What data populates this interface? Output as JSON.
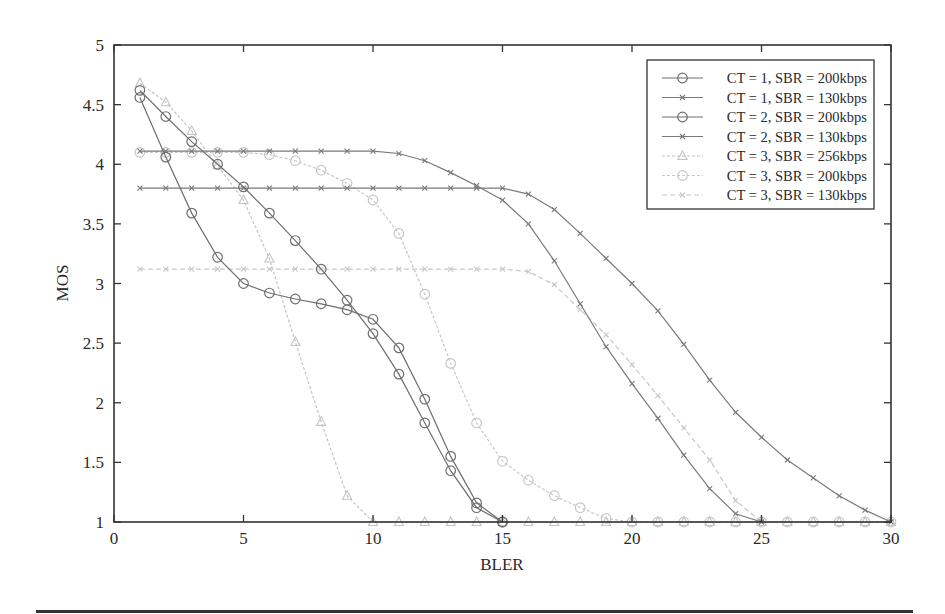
{
  "chart_data": {
    "type": "line",
    "title": "",
    "xlabel": "BLER",
    "ylabel": "MOS",
    "xlim": [
      0,
      30
    ],
    "ylim": [
      1,
      5
    ],
    "xticks": [
      0,
      5,
      10,
      15,
      20,
      25,
      30
    ],
    "yticks": [
      1,
      1.5,
      2,
      2.5,
      3,
      3.5,
      4,
      4.5,
      5
    ],
    "xtick_labels": [
      "0",
      "5",
      "10",
      "15",
      "20",
      "25",
      "30"
    ],
    "ytick_labels": [
      "1",
      "1.5",
      "2",
      "2.5",
      "3",
      "3.5",
      "4",
      "4.5",
      "5"
    ],
    "grid": false,
    "legend_position": "upper right",
    "series": [
      {
        "name": "CT = 1, SBR = 200kbps",
        "marker": "circle",
        "color": "#6e6e6e",
        "dash": "",
        "x": [
          1,
          2,
          3,
          4,
          5,
          6,
          7,
          8,
          9,
          10,
          11,
          12,
          13,
          14,
          15
        ],
        "values": [
          4.56,
          4.06,
          3.59,
          3.22,
          3.0,
          2.92,
          2.87,
          2.83,
          2.78,
          2.7,
          2.46,
          2.03,
          1.55,
          1.16,
          1.0
        ]
      },
      {
        "name": "CT = 1, SBR = 130kbps",
        "marker": "x",
        "color": "#7a7a7a",
        "dash": "",
        "x": [
          1,
          2,
          3,
          4,
          5,
          6,
          7,
          8,
          9,
          10,
          11,
          12,
          13,
          14,
          15,
          16,
          17,
          18,
          19,
          20,
          21,
          22,
          23,
          24,
          25
        ],
        "values": [
          4.11,
          4.11,
          4.11,
          4.11,
          4.11,
          4.11,
          4.11,
          4.11,
          4.11,
          4.11,
          4.09,
          4.03,
          3.93,
          3.82,
          3.7,
          3.5,
          3.19,
          2.83,
          2.47,
          2.16,
          1.87,
          1.56,
          1.28,
          1.07,
          1.0
        ]
      },
      {
        "name": "CT = 2, SBR = 200kbps",
        "marker": "circle",
        "color": "#6e6e6e",
        "dash": "",
        "x": [
          1,
          2,
          3,
          4,
          5,
          6,
          7,
          8,
          9,
          10,
          11,
          12,
          13,
          14,
          15
        ],
        "values": [
          4.62,
          4.4,
          4.19,
          4.0,
          3.81,
          3.59,
          3.36,
          3.12,
          2.86,
          2.58,
          2.24,
          1.83,
          1.43,
          1.12,
          1.0
        ]
      },
      {
        "name": "CT = 2, SBR = 130kbps",
        "marker": "x",
        "color": "#7a7a7a",
        "dash": "",
        "x": [
          1,
          2,
          3,
          4,
          5,
          6,
          7,
          8,
          9,
          10,
          11,
          12,
          13,
          14,
          15,
          16,
          17,
          18,
          19,
          20,
          21,
          22,
          23,
          24,
          25,
          26,
          27,
          28,
          29,
          30
        ],
        "values": [
          3.8,
          3.8,
          3.8,
          3.8,
          3.8,
          3.8,
          3.8,
          3.8,
          3.8,
          3.8,
          3.8,
          3.8,
          3.8,
          3.8,
          3.8,
          3.75,
          3.62,
          3.42,
          3.21,
          3.0,
          2.77,
          2.49,
          2.19,
          1.92,
          1.71,
          1.52,
          1.37,
          1.22,
          1.1,
          1.0
        ]
      },
      {
        "name": "CT = 3, SBR = 256kbps",
        "marker": "triangle",
        "color": "#c4c4c4",
        "dash": "3,2",
        "x": [
          1,
          2,
          3,
          4,
          5,
          6,
          7,
          8,
          9,
          10,
          11,
          12,
          13,
          14,
          15,
          16,
          17,
          18,
          19,
          20,
          21,
          22,
          23,
          24,
          25,
          26,
          27,
          28,
          29,
          30
        ],
        "values": [
          4.68,
          4.52,
          4.28,
          3.99,
          3.7,
          3.21,
          2.51,
          1.84,
          1.22,
          1.0,
          1.0,
          1.0,
          1.0,
          1.0,
          1.0,
          1.0,
          1.0,
          1.0,
          1.0,
          1.0,
          1.0,
          1.0,
          1.0,
          1.0,
          1.0,
          1.0,
          1.0,
          1.0,
          1.0,
          1.0
        ]
      },
      {
        "name": "CT = 3, SBR = 200kbps",
        "marker": "circle",
        "color": "#c8c8c8",
        "dash": "3,2",
        "x": [
          1,
          2,
          3,
          4,
          5,
          6,
          7,
          8,
          9,
          10,
          11,
          12,
          13,
          14,
          15,
          16,
          17,
          18,
          19,
          20,
          21,
          22,
          23,
          24,
          25,
          26,
          27,
          28,
          29,
          30
        ],
        "values": [
          4.1,
          4.1,
          4.1,
          4.1,
          4.1,
          4.08,
          4.03,
          3.95,
          3.84,
          3.7,
          3.42,
          2.91,
          2.33,
          1.83,
          1.51,
          1.35,
          1.22,
          1.12,
          1.03,
          1.0,
          1.0,
          1.0,
          1.0,
          1.0,
          1.0,
          1.0,
          1.0,
          1.0,
          1.0,
          1.0
        ]
      },
      {
        "name": "CT = 3, SBR = 130kbps",
        "marker": "x",
        "color": "#c8c8c8",
        "dash": "5,3",
        "x": [
          1,
          2,
          3,
          4,
          5,
          6,
          7,
          8,
          9,
          10,
          11,
          12,
          13,
          14,
          15,
          16,
          17,
          18,
          19,
          20,
          21,
          22,
          23,
          24,
          25
        ],
        "values": [
          3.12,
          3.12,
          3.12,
          3.12,
          3.12,
          3.12,
          3.12,
          3.12,
          3.12,
          3.12,
          3.12,
          3.12,
          3.12,
          3.12,
          3.12,
          3.1,
          2.99,
          2.78,
          2.57,
          2.32,
          2.06,
          1.79,
          1.52,
          1.18,
          1.0
        ]
      }
    ]
  }
}
